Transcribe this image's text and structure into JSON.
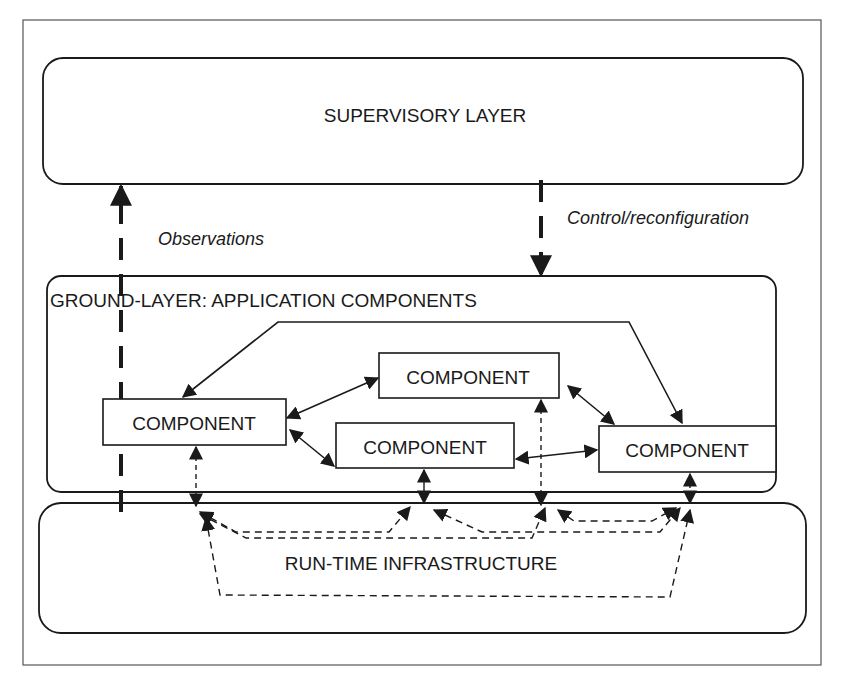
{
  "diagram": {
    "colors": {
      "line": "#1a1a1a",
      "frame": "#333333",
      "background": "#ffffff"
    },
    "layers": {
      "supervisory": {
        "label": "SUPERVISORY LAYER"
      },
      "ground": {
        "label": "GROUND-LAYER: APPLICATION COMPONENTS"
      },
      "runtime": {
        "label": "RUN-TIME INFRASTRUCTURE"
      }
    },
    "components": [
      {
        "id": "left",
        "label": "COMPONENT"
      },
      {
        "id": "top-middle",
        "label": "COMPONENT"
      },
      {
        "id": "middle",
        "label": "COMPONENT"
      },
      {
        "id": "right",
        "label": "COMPONENT"
      }
    ],
    "annotations": {
      "observations": "Observations",
      "control": "Control/reconfiguration"
    },
    "edges": [
      {
        "from": "left",
        "to": "top-middle",
        "style": "solid",
        "bidirectional": true
      },
      {
        "from": "left",
        "to": "middle",
        "style": "solid",
        "bidirectional": true
      },
      {
        "from": "top-middle",
        "to": "right",
        "style": "solid",
        "bidirectional": true
      },
      {
        "from": "middle",
        "to": "right",
        "style": "solid",
        "bidirectional": true
      },
      {
        "from": "right",
        "to": "left",
        "style": "solid",
        "bidirectional": true,
        "routed": "over-top"
      },
      {
        "from": "components",
        "to": "run-time-infrastructure",
        "style": "dashed",
        "bidirectional": true
      },
      {
        "from": "ground-layer",
        "to": "supervisory-layer",
        "style": "dashed-heavy",
        "label": "Observations"
      },
      {
        "from": "supervisory-layer",
        "to": "ground-layer",
        "style": "dashed-heavy",
        "label": "Control/reconfiguration"
      }
    ]
  }
}
